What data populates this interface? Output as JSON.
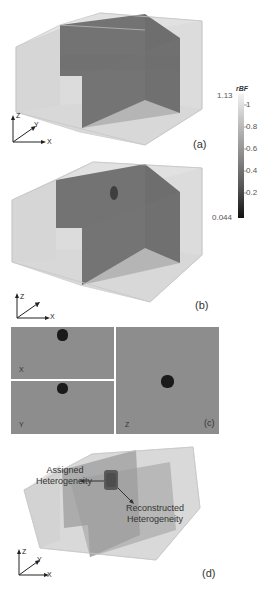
{
  "figure": {
    "panels": [
      {
        "id": "a",
        "label": "(a)",
        "description": "3D cross-sectional slices of reconstructed rBF (homogeneous)"
      },
      {
        "id": "b",
        "label": "(b)",
        "description": "3D cross-sectional slices of reconstructed rBF with heterogeneity"
      },
      {
        "id": "c",
        "label": "(c)",
        "description": "2D orthogonal slices",
        "slices": [
          {
            "axis_label": "X"
          },
          {
            "axis_label": "Y"
          },
          {
            "axis_label": "Z"
          }
        ]
      },
      {
        "id": "d",
        "label": "(d)",
        "description": "Assigned vs reconstructed heterogeneity",
        "annotations": {
          "assigned_line1": "Assigned",
          "assigned_line2": "Heterogeneity",
          "reconstructed_line1": "Reconstructed",
          "reconstructed_line2": "Heterogeneity"
        }
      }
    ],
    "axes_triad": {
      "z": "Z",
      "y": "Y",
      "x": "X"
    },
    "colorbar": {
      "title": "rBF",
      "max_label": "1.13",
      "min_label": "0.044",
      "ticks": [
        "1",
        "0.8",
        "0.6",
        "0.4",
        "0.2"
      ],
      "colormap": "grayscale",
      "color_low": "#111111",
      "color_high": "#f2f2f2"
    },
    "colors": {
      "box_face": "#d6d6d6",
      "box_edge": "#c4c4c4",
      "slice_plane": "#777777",
      "slice_plane_dark": "#6c6c6c",
      "heterogeneity": "#1a1a1a",
      "panel_c_bg": "#8d8d8d"
    }
  }
}
